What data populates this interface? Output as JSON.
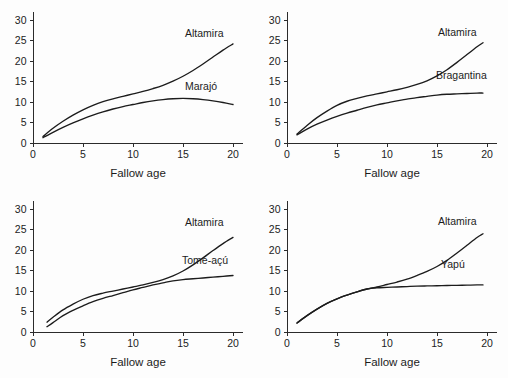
{
  "figure": {
    "background_color": "#fdfdfd",
    "line_color": "#1c1c1c",
    "panel_count": 4
  },
  "chart_data": [
    {
      "type": "line",
      "panel": "top-left",
      "title": "",
      "xlabel": "Fallow age",
      "ylabel": "",
      "xlim": [
        0,
        21
      ],
      "ylim": [
        0,
        32
      ],
      "xticks": [
        0,
        5,
        10,
        15,
        20
      ],
      "yticks": [
        0,
        5,
        10,
        15,
        20,
        25,
        30
      ],
      "xticklabels": [
        "0",
        "5",
        "10",
        "15",
        "20"
      ],
      "yticklabels": [
        "0",
        "5",
        "10",
        "15",
        "20",
        "25",
        "30"
      ],
      "grid": false,
      "legend": "inline-annotation",
      "series": [
        {
          "name": "Altamira",
          "label_position": {
            "x": 15.2,
            "y": 26.0
          },
          "x": [
            1.0,
            2.0,
            3.0,
            4.0,
            5.0,
            6.0,
            7.0,
            8.0,
            9.0,
            10.0,
            11.0,
            12.0,
            13.0,
            14.0,
            15.0,
            16.0,
            17.0,
            18.0,
            19.0,
            20.0
          ],
          "y": [
            1.6,
            3.6,
            5.3,
            6.8,
            8.1,
            9.2,
            10.1,
            10.8,
            11.4,
            12.0,
            12.6,
            13.3,
            14.1,
            15.1,
            16.3,
            17.7,
            19.3,
            21.0,
            22.7,
            24.2
          ]
        },
        {
          "name": "Marajó",
          "label_position": {
            "x": 15.2,
            "y": 12.9
          },
          "x": [
            1.0,
            2.0,
            3.0,
            4.0,
            5.0,
            6.0,
            7.0,
            8.0,
            9.0,
            10.0,
            11.0,
            12.0,
            13.0,
            14.0,
            15.0,
            16.0,
            17.0,
            18.0,
            19.0,
            20.0
          ],
          "y": [
            1.3,
            2.6,
            3.8,
            4.9,
            5.9,
            6.8,
            7.6,
            8.3,
            8.9,
            9.4,
            9.9,
            10.3,
            10.6,
            10.8,
            10.9,
            10.8,
            10.6,
            10.3,
            9.9,
            9.4
          ]
        }
      ]
    },
    {
      "type": "line",
      "panel": "top-right",
      "title": "",
      "xlabel": "Fallow age",
      "ylabel": "",
      "xlim": [
        0,
        21
      ],
      "ylim": [
        0,
        32
      ],
      "xticks": [
        0,
        5,
        10,
        15,
        20
      ],
      "yticks": [
        0,
        5,
        10,
        15,
        20,
        25,
        30
      ],
      "xticklabels": [
        "0",
        "5",
        "10",
        "15",
        "20"
      ],
      "yticklabels": [
        "0",
        "5",
        "10",
        "15",
        "20",
        "25",
        "30"
      ],
      "grid": false,
      "legend": "inline-annotation",
      "series": [
        {
          "name": "Altamira",
          "label_position": {
            "x": 15.1,
            "y": 26.1
          },
          "x": [
            1.0,
            2.0,
            3.0,
            4.0,
            5.0,
            6.0,
            7.0,
            8.0,
            9.0,
            10.0,
            11.0,
            12.0,
            13.0,
            14.0,
            15.0,
            16.0,
            17.0,
            18.0,
            19.0,
            19.6
          ],
          "y": [
            2.2,
            4.3,
            6.2,
            7.8,
            9.2,
            10.2,
            10.9,
            11.5,
            12.0,
            12.5,
            13.0,
            13.6,
            14.3,
            15.2,
            16.4,
            17.9,
            19.7,
            21.6,
            23.5,
            24.5
          ]
        },
        {
          "name": "Bragantina",
          "label_position": {
            "x": 14.9,
            "y": 15.6
          },
          "x": [
            1.0,
            2.0,
            3.0,
            4.0,
            5.0,
            6.0,
            7.0,
            8.0,
            9.0,
            10.0,
            11.0,
            12.0,
            13.0,
            14.0,
            15.0,
            16.0,
            17.0,
            18.0,
            19.0,
            19.6
          ],
          "y": [
            2.0,
            3.4,
            4.6,
            5.6,
            6.5,
            7.3,
            8.0,
            8.7,
            9.3,
            9.8,
            10.3,
            10.7,
            11.1,
            11.4,
            11.7,
            11.9,
            12.0,
            12.1,
            12.2,
            12.2
          ]
        }
      ]
    },
    {
      "type": "line",
      "panel": "bottom-left",
      "title": "",
      "xlabel": "Fallow age",
      "ylabel": "",
      "xlim": [
        0,
        21
      ],
      "ylim": [
        0,
        32
      ],
      "xticks": [
        0,
        5,
        10,
        15,
        20
      ],
      "yticks": [
        0,
        5,
        10,
        15,
        20,
        25,
        30
      ],
      "xticklabels": [
        "0",
        "5",
        "10",
        "15",
        "20"
      ],
      "yticklabels": [
        "0",
        "5",
        "10",
        "15",
        "20",
        "25",
        "30"
      ],
      "grid": false,
      "legend": "inline-annotation",
      "series": [
        {
          "name": "Altamira",
          "label_position": {
            "x": 15.2,
            "y": 25.8
          },
          "x": [
            1.4,
            2.0,
            3.0,
            4.0,
            5.0,
            6.0,
            7.0,
            8.0,
            9.0,
            10.0,
            11.0,
            12.0,
            13.0,
            14.0,
            15.0,
            16.0,
            17.0,
            18.0,
            19.0,
            20.0
          ],
          "y": [
            2.4,
            3.6,
            5.4,
            6.8,
            8.0,
            8.9,
            9.5,
            10.0,
            10.5,
            11.0,
            11.5,
            12.1,
            12.8,
            13.7,
            14.9,
            16.4,
            18.1,
            19.9,
            21.6,
            23.1
          ]
        },
        {
          "name": "Tomé-açú",
          "label_position": {
            "x": 14.9,
            "y": 16.6
          },
          "x": [
            1.4,
            2.0,
            3.0,
            4.0,
            5.0,
            6.0,
            7.0,
            8.0,
            9.0,
            10.0,
            11.0,
            12.0,
            13.0,
            14.0,
            15.0,
            16.0,
            17.0,
            18.0,
            19.0,
            20.0
          ],
          "y": [
            1.3,
            2.3,
            4.0,
            5.3,
            6.4,
            7.4,
            8.2,
            8.9,
            9.6,
            10.3,
            10.9,
            11.5,
            12.0,
            12.5,
            12.8,
            13.0,
            13.2,
            13.4,
            13.6,
            13.8
          ]
        }
      ]
    },
    {
      "type": "line",
      "panel": "bottom-right",
      "title": "",
      "xlabel": "Fallow age",
      "ylabel": "",
      "xlim": [
        0,
        21
      ],
      "ylim": [
        0,
        32
      ],
      "xticks": [
        0,
        5,
        10,
        15,
        20
      ],
      "yticks": [
        0,
        5,
        10,
        15,
        20,
        25,
        30
      ],
      "xticklabels": [
        "0",
        "5",
        "10",
        "15",
        "20"
      ],
      "yticklabels": [
        "0",
        "5",
        "10",
        "15",
        "20",
        "25",
        "30"
      ],
      "grid": false,
      "legend": "inline-annotation",
      "series": [
        {
          "name": "Altamira",
          "label_position": {
            "x": 15.1,
            "y": 26.1
          },
          "x": [
            1.0,
            2.0,
            3.0,
            4.0,
            5.0,
            6.0,
            7.0,
            8.0,
            9.0,
            10.0,
            11.0,
            12.0,
            13.0,
            14.0,
            15.0,
            16.0,
            17.0,
            18.0,
            19.0,
            19.6
          ],
          "y": [
            2.2,
            4.0,
            5.6,
            7.0,
            8.1,
            9.0,
            9.8,
            10.5,
            11.0,
            11.6,
            12.2,
            12.9,
            13.8,
            14.8,
            16.0,
            17.5,
            19.3,
            21.2,
            23.1,
            24.0
          ]
        },
        {
          "name": "Yapú",
          "label_position": {
            "x": 15.4,
            "y": 15.6
          },
          "x": [
            1.0,
            2.0,
            3.0,
            4.0,
            5.0,
            6.0,
            7.0,
            8.0,
            9.0,
            10.0,
            11.0,
            12.0,
            13.0,
            14.0,
            15.0,
            16.0,
            17.0,
            18.0,
            19.0,
            19.6
          ],
          "y": [
            2.2,
            4.0,
            5.6,
            7.0,
            8.1,
            9.0,
            9.8,
            10.5,
            10.8,
            10.9,
            11.0,
            11.1,
            11.2,
            11.25,
            11.3,
            11.35,
            11.4,
            11.45,
            11.5,
            11.5
          ]
        }
      ]
    }
  ],
  "panels": {
    "top_left": {
      "xlabel": "Fallow age",
      "series_labels": [
        "Altamira",
        "Marajó"
      ],
      "yticks": [
        "0",
        "5",
        "10",
        "15",
        "20",
        "25",
        "30"
      ],
      "xticks": [
        "0",
        "5",
        "10",
        "15",
        "20"
      ]
    },
    "top_right": {
      "xlabel": "Fallow age",
      "series_labels": [
        "Altamira",
        "Bragantina"
      ],
      "yticks": [
        "0",
        "5",
        "10",
        "15",
        "20",
        "25",
        "30"
      ],
      "xticks": [
        "0",
        "5",
        "10",
        "15",
        "20"
      ]
    },
    "bottom_left": {
      "xlabel": "Fallow age",
      "series_labels": [
        "Altamira",
        "Tomé-açú"
      ],
      "yticks": [
        "0",
        "5",
        "10",
        "15",
        "20",
        "25",
        "30"
      ],
      "xticks": [
        "0",
        "5",
        "10",
        "15",
        "20"
      ]
    },
    "bottom_right": {
      "xlabel": "Fallow age",
      "series_labels": [
        "Altamira",
        "Yapú"
      ],
      "yticks": [
        "0",
        "5",
        "10",
        "15",
        "20",
        "25",
        "30"
      ],
      "xticks": [
        "0",
        "5",
        "10",
        "15",
        "20"
      ]
    }
  }
}
